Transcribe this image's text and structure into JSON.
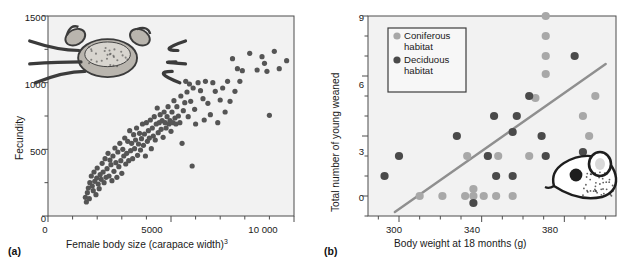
{
  "figure": {
    "background_color": "#ffffff",
    "frame_color": "#4d4d4d",
    "plot_bg_color": "#f2f2f2"
  },
  "panels": [
    {
      "key": "a",
      "label": "(a)",
      "illustration": "crab-illustration",
      "chart_data": {
        "type": "scatter",
        "title": "",
        "xlabel": "Female body size (carapace width)",
        "xlabel_superscript": "3",
        "ylabel": "Fecundity",
        "xlim": [
          0,
          10000
        ],
        "ylim": [
          0,
          1500
        ],
        "xticks": [
          0,
          5000,
          10000
        ],
        "xticklabels": [
          "0",
          "5000",
          "10 000"
        ],
        "xminor_step": 1000,
        "yticks": [
          0,
          500,
          1000,
          1500
        ],
        "yticklabels": [
          "0",
          "500",
          "1000",
          "1500"
        ],
        "yminor_step": 250,
        "grid": false,
        "legend": null,
        "marker_color": "#555555",
        "marker_size": 2.6,
        "series": [
          {
            "name": "Crab fecundity",
            "points": [
              [
                1520,
                140
              ],
              [
                1560,
                105
              ],
              [
                1600,
                175
              ],
              [
                1640,
                210
              ],
              [
                1680,
                130
              ],
              [
                1700,
                250
              ],
              [
                1760,
                300
              ],
              [
                1800,
                225
              ],
              [
                1840,
                190
              ],
              [
                1870,
                330
              ],
              [
                1900,
                260
              ],
              [
                1950,
                160
              ],
              [
                1980,
                285
              ],
              [
                2000,
                360
              ],
              [
                2040,
                240
              ],
              [
                2080,
                205
              ],
              [
                2120,
                310
              ],
              [
                2160,
                275
              ],
              [
                2200,
                395
              ],
              [
                2240,
                330
              ],
              [
                2280,
                250
              ],
              [
                2320,
                430
              ],
              [
                2360,
                290
              ],
              [
                2400,
                355
              ],
              [
                2440,
                470
              ],
              [
                2480,
                300
              ],
              [
                2520,
                420
              ],
              [
                2560,
                385
              ],
              [
                2600,
                265
              ],
              [
                2640,
                450
              ],
              [
                2680,
                335
              ],
              [
                2720,
                510
              ],
              [
                2760,
                400
              ],
              [
                2800,
                290
              ],
              [
                2840,
                480
              ],
              [
                2880,
                370
              ],
              [
                2920,
                545
              ],
              [
                2960,
                415
              ],
              [
                3000,
                320
              ],
              [
                3040,
                500
              ],
              [
                3080,
                450
              ],
              [
                3120,
                585
              ],
              [
                3160,
                390
              ],
              [
                3200,
                470
              ],
              [
                3240,
                560
              ],
              [
                3280,
                415
              ],
              [
                3320,
                640
              ],
              [
                3360,
                490
              ],
              [
                3400,
                545
              ],
              [
                3440,
                430
              ],
              [
                3480,
                610
              ],
              [
                3520,
                505
              ],
              [
                3560,
                570
              ],
              [
                3600,
                660
              ],
              [
                3640,
                455
              ],
              [
                3680,
                540
              ],
              [
                3720,
                620
              ],
              [
                3760,
                495
              ],
              [
                3800,
                580
              ],
              [
                3840,
                690
              ],
              [
                3880,
                530
              ],
              [
                3920,
                615
              ],
              [
                3960,
                450
              ],
              [
                4000,
                700
              ],
              [
                4040,
                560
              ],
              [
                4080,
                640
              ],
              [
                4120,
                585
              ],
              [
                4160,
                720
              ],
              [
                4200,
                505
              ],
              [
                4240,
                660
              ],
              [
                4280,
                600
              ],
              [
                4320,
                745
              ],
              [
                4360,
                570
              ],
              [
                4400,
                690
              ],
              [
                4440,
                810
              ],
              [
                4480,
                625
              ],
              [
                4520,
                700
              ],
              [
                4560,
                760
              ],
              [
                4600,
                650
              ],
              [
                4640,
                715
              ],
              [
                4680,
                590
              ],
              [
                4720,
                780
              ],
              [
                4760,
                700
              ],
              [
                4800,
                660
              ],
              [
                4840,
                745
              ],
              [
                4880,
                820
              ],
              [
                4920,
                690
              ],
              [
                4960,
                715
              ],
              [
                5000,
                635
              ],
              [
                5040,
                780
              ],
              [
                5080,
                700
              ],
              [
                5120,
                865
              ],
              [
                5160,
                735
              ],
              [
                5200,
                690
              ],
              [
                5240,
                820
              ],
              [
                5300,
                750
              ],
              [
                5360,
                700
              ],
              [
                5400,
                900
              ],
              [
                5450,
                545
              ],
              [
                5500,
                790
              ],
              [
                5560,
                850
              ],
              [
                5600,
                1010
              ],
              [
                5650,
                930
              ],
              [
                5700,
                745
              ],
              [
                5750,
                990
              ],
              [
                5800,
                860
              ],
              [
                5860,
                375
              ],
              [
                5900,
                960
              ],
              [
                5960,
                800
              ],
              [
                6000,
                690
              ],
              [
                6100,
                1000
              ],
              [
                6200,
                940
              ],
              [
                6300,
                880
              ],
              [
                6350,
                720
              ],
              [
                6400,
                1010
              ],
              [
                6500,
                845
              ],
              [
                6600,
                760
              ],
              [
                6700,
                1000
              ],
              [
                6800,
                935
              ],
              [
                6900,
                700
              ],
              [
                7000,
                870
              ],
              [
                7100,
                960
              ],
              [
                7200,
                780
              ],
              [
                7300,
                1010
              ],
              [
                7400,
                860
              ],
              [
                7500,
                1180
              ],
              [
                7600,
                935
              ],
              [
                7700,
                1105
              ],
              [
                7800,
                1010
              ],
              [
                7900,
                1090
              ],
              [
                8200,
                1220
              ],
              [
                8500,
                1095
              ],
              [
                8700,
                1195
              ],
              [
                8800,
                1145
              ],
              [
                8900,
                1085
              ],
              [
                9000,
                755
              ],
              [
                9200,
                1235
              ],
              [
                9400,
                1105
              ],
              [
                9700,
                1165
              ]
            ]
          }
        ]
      }
    },
    {
      "key": "b",
      "label": "(b)",
      "illustration": "vole-illustration",
      "chart_data": {
        "type": "scatter",
        "title": "",
        "xlabel": "Body weight at 18 months (g)",
        "ylabel": "Total number of young weaned",
        "xlim": [
          285,
          405
        ],
        "ylim": [
          -1,
          9
        ],
        "xticks": [
          300,
          340,
          380
        ],
        "xticklabels": [
          "300",
          "340",
          "380"
        ],
        "xminor_step": 10,
        "yticks": [
          0,
          3,
          6,
          9
        ],
        "yticklabels": [
          "0",
          "3",
          "6",
          "9"
        ],
        "yminor_step": 1,
        "grid": false,
        "legend": {
          "position": "top-left",
          "box": true,
          "entries": [
            {
              "label": "Coniferous\nhabitat",
              "color": "#a8a8a8",
              "name": "coniferous"
            },
            {
              "label": "Deciduous\nhabitat",
              "color": "#4a4a4a",
              "name": "deciduous"
            }
          ]
        },
        "trendline": {
          "color": "#8f8f8f",
          "width": 2.4,
          "x0": 298,
          "y0": -0.8,
          "x1": 400,
          "y1": 6.6
        },
        "marker_size": 4.1,
        "series": [
          {
            "name": "Coniferous habitat",
            "color": "#a8a8a8",
            "points": [
              [
                310,
                0
              ],
              [
                321,
                0
              ],
              [
                332,
                0
              ],
              [
                333,
                2
              ],
              [
                336,
                0.35
              ],
              [
                336,
                0
              ],
              [
                341,
                0
              ],
              [
                343,
                2
              ],
              [
                347,
                0
              ],
              [
                355,
                0
              ],
              [
                348,
                2
              ],
              [
                363,
                2
              ],
              [
                366,
                4.9
              ],
              [
                371,
                8
              ],
              [
                371,
                7
              ],
              [
                371,
                6.1
              ],
              [
                371,
                9
              ],
              [
                389,
                4
              ],
              [
                392,
                3
              ],
              [
                395,
                5
              ]
            ]
          },
          {
            "name": "Deciduous habitat",
            "color": "#4a4a4a",
            "points": [
              [
                293,
                1
              ],
              [
                300,
                2
              ],
              [
                328,
                3
              ],
              [
                336,
                -0.35
              ],
              [
                343,
                2
              ],
              [
                346,
                4
              ],
              [
                347,
                1
              ],
              [
                355,
                1
              ],
              [
                355,
                3.2
              ],
              [
                357,
                4
              ],
              [
                363,
                5
              ],
              [
                369,
                3
              ],
              [
                371,
                2
              ],
              [
                385,
                7
              ],
              [
                389,
                2.2
              ]
            ]
          }
        ]
      }
    }
  ]
}
